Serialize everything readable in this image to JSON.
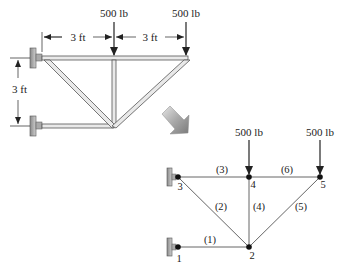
{
  "upper_truss": {
    "loads": [
      {
        "label": "500 lb",
        "at": "middle-top"
      },
      {
        "label": "500 lb",
        "at": "right-top"
      }
    ],
    "dimensions": {
      "horizontal_left": "3 ft",
      "horizontal_right": "3 ft",
      "vertical": "3 ft"
    }
  },
  "transform_arrow": "arrow-down-right",
  "model": {
    "nodes": [
      {
        "id": "1",
        "label": "1"
      },
      {
        "id": "2",
        "label": "2"
      },
      {
        "id": "3",
        "label": "3"
      },
      {
        "id": "4",
        "label": "4"
      },
      {
        "id": "5",
        "label": "5"
      }
    ],
    "elements": [
      {
        "id": "1",
        "label": "(1)",
        "from": "1",
        "to": "2"
      },
      {
        "id": "2",
        "label": "(2)",
        "from": "3",
        "to": "2"
      },
      {
        "id": "3",
        "label": "(3)",
        "from": "3",
        "to": "4"
      },
      {
        "id": "4",
        "label": "(4)",
        "from": "4",
        "to": "2"
      },
      {
        "id": "5",
        "label": "(5)",
        "from": "2",
        "to": "5"
      },
      {
        "id": "6",
        "label": "(6)",
        "from": "4",
        "to": "5"
      }
    ],
    "loads": [
      {
        "label": "500 lb",
        "node": "4"
      },
      {
        "label": "500 lb",
        "node": "5"
      }
    ]
  }
}
